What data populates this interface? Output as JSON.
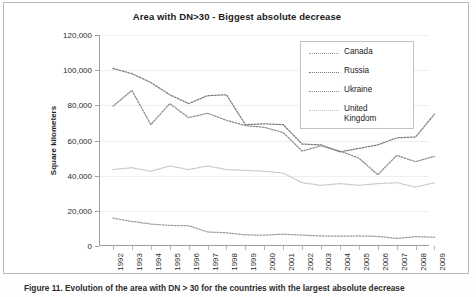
{
  "figure": {
    "title": "Area with DN>30 - Biggest absolute decrease",
    "caption": "Figure 11. Evolution of the area with DN > 30 for the countries with the largest absolute decrease"
  },
  "chart_data": {
    "type": "line",
    "title": "Area with DN>30 - Biggest absolute decrease",
    "xlabel": "",
    "ylabel": "Square kilometers",
    "ylim": [
      0,
      120000
    ],
    "ytick_labels": [
      "120,000",
      "100,000",
      "80,000",
      "60,000",
      "40,000",
      "20,000",
      "0"
    ],
    "ytick_values": [
      120000,
      100000,
      80000,
      60000,
      40000,
      20000,
      0
    ],
    "grid": true,
    "legend_position": "top-right",
    "categories": [
      "1992",
      "1993",
      "1994",
      "1995",
      "1996",
      "1997",
      "1998",
      "1999",
      "2000",
      "2001",
      "2002",
      "2003",
      "2004",
      "2005",
      "2006",
      "2007",
      "2008",
      "2009"
    ],
    "series": [
      {
        "name": "Russia",
        "color": "#7a7a7a",
        "values": [
          101000,
          98000,
          93000,
          86000,
          81000,
          85500,
          86000,
          69000,
          69500,
          69000,
          58000,
          57500,
          53500,
          55500,
          57500,
          61500,
          62000,
          75000
        ]
      },
      {
        "name": "Ukraine",
        "color": "#8d8d8d",
        "values": [
          79500,
          88500,
          69000,
          81000,
          73000,
          75500,
          71500,
          68500,
          67500,
          64500,
          54000,
          57000,
          54000,
          50000,
          40500,
          51500,
          48000,
          51000
        ]
      },
      {
        "name": "United Kingdom",
        "color": "#c4c4c4",
        "values": [
          43500,
          44500,
          42500,
          45500,
          43500,
          45500,
          43500,
          43000,
          42500,
          41500,
          36000,
          34500,
          35500,
          34500,
          35500,
          36000,
          33500,
          36000
        ]
      },
      {
        "name": "Canada",
        "color": "#9c9c9c",
        "values": [
          15800,
          14000,
          12500,
          11700,
          11500,
          8000,
          7500,
          6300,
          6200,
          6700,
          6200,
          5700,
          5600,
          5700,
          5500,
          4300,
          5300,
          5000
        ]
      }
    ]
  },
  "legend": {
    "items": [
      {
        "label": "Canada"
      },
      {
        "label": "Russia"
      },
      {
        "label": "Ukraine"
      },
      {
        "label": "United Kingdom"
      }
    ]
  }
}
